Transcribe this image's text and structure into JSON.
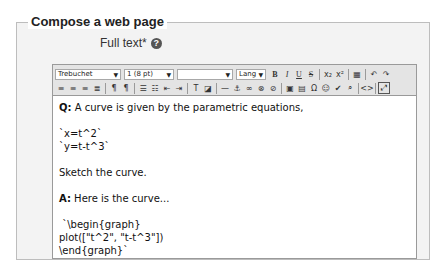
{
  "fieldset": {
    "legend": "Compose a web page",
    "field_label": "Full text*",
    "help_icon": "?"
  },
  "toolbar": {
    "font_family": "Trebuchet",
    "font_size": "1 (8 pt)",
    "heading": "",
    "lang": "Lang",
    "row1_buttons": [
      {
        "name": "bold",
        "glyph": "B"
      },
      {
        "name": "italic",
        "glyph": "I"
      },
      {
        "name": "underline",
        "glyph": "U"
      },
      {
        "name": "strikethrough",
        "glyph": "S"
      },
      {
        "name": "subscript",
        "glyph": "x₂"
      },
      {
        "name": "superscript",
        "glyph": "x²"
      },
      {
        "name": "clean-html",
        "glyph": "▦"
      },
      {
        "name": "undo",
        "glyph": "↶"
      },
      {
        "name": "redo",
        "glyph": "↷"
      }
    ],
    "row2_buttons": [
      {
        "name": "align-left",
        "glyph": "≡"
      },
      {
        "name": "align-center",
        "glyph": "≡"
      },
      {
        "name": "align-right",
        "glyph": "≡"
      },
      {
        "name": "justify",
        "glyph": "≣"
      },
      {
        "name": "ltr",
        "glyph": "¶"
      },
      {
        "name": "rtl",
        "glyph": "¶"
      },
      {
        "name": "ordered-list",
        "glyph": "☰"
      },
      {
        "name": "unordered-list",
        "glyph": "☷"
      },
      {
        "name": "outdent",
        "glyph": "⇤"
      },
      {
        "name": "indent",
        "glyph": "⇥"
      },
      {
        "name": "text-color",
        "glyph": "T"
      },
      {
        "name": "background-color",
        "glyph": "◪"
      },
      {
        "name": "horizontal-rule",
        "glyph": "—"
      },
      {
        "name": "anchor",
        "glyph": "⚓"
      },
      {
        "name": "link",
        "glyph": "∞"
      },
      {
        "name": "unlink",
        "glyph": "⊗"
      },
      {
        "name": "nolink",
        "glyph": "⊘"
      },
      {
        "name": "image",
        "glyph": "▣"
      },
      {
        "name": "table",
        "glyph": "▤"
      },
      {
        "name": "symbol",
        "glyph": "Ω"
      },
      {
        "name": "smiley",
        "glyph": "☺"
      },
      {
        "name": "spellcheck",
        "glyph": "✔"
      },
      {
        "name": "search-replace",
        "glyph": "⌕"
      },
      {
        "name": "html-source",
        "glyph": "<>"
      },
      {
        "name": "fullscreen",
        "glyph": "⤢"
      }
    ]
  },
  "content": {
    "lines": [
      {
        "type": "q",
        "prefix": "Q:",
        "text": " A curve is given by the parametric equations,"
      },
      {
        "type": "blank"
      },
      {
        "type": "text",
        "text": "`x=t^2`"
      },
      {
        "type": "text",
        "text": "`y=t-t^3`"
      },
      {
        "type": "blank"
      },
      {
        "type": "text",
        "text": "Sketch the curve."
      },
      {
        "type": "blank"
      },
      {
        "type": "a",
        "prefix": "A:",
        "text": " Here is the curve..."
      },
      {
        "type": "blank"
      },
      {
        "type": "text",
        "text": " `\\begin{graph}"
      },
      {
        "type": "text",
        "text": "plot([\"t^2\", \"t-t^3\"])"
      },
      {
        "type": "text",
        "text": "\\end{graph}`"
      }
    ]
  }
}
